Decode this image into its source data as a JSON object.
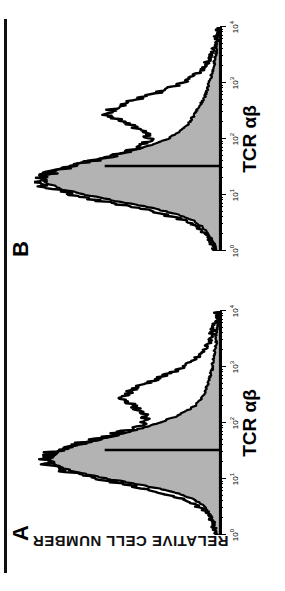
{
  "figure": {
    "y_axis_title": "RELATIVE CELL NUMBER",
    "orientation_note": "rotated-180",
    "colors": {
      "ink": "#000000",
      "fill_shaded": "#b3b3b3",
      "background": "#ffffff"
    }
  },
  "panels": [
    {
      "letter": "A",
      "x_axis_title": "TCR αβ",
      "ticks": [
        {
          "label_base": "10",
          "label_exp": "0",
          "value": 1
        },
        {
          "label_base": "10",
          "label_exp": "1",
          "value": 10
        },
        {
          "label_base": "10",
          "label_exp": "2",
          "value": 100
        },
        {
          "label_base": "10",
          "label_exp": "3",
          "value": 1000
        },
        {
          "label_base": "10",
          "label_exp": "4",
          "value": 10000
        }
      ]
    },
    {
      "letter": "B",
      "x_axis_title": "TCR αβ",
      "ticks": [
        {
          "label_base": "10",
          "label_exp": "0",
          "value": 1
        },
        {
          "label_base": "10",
          "label_exp": "1",
          "value": 10
        },
        {
          "label_base": "10",
          "label_exp": "2",
          "value": 100
        },
        {
          "label_base": "10",
          "label_exp": "3",
          "value": 1000
        },
        {
          "label_base": "10",
          "label_exp": "4",
          "value": 10000
        }
      ]
    }
  ],
  "chart_data": {
    "type": "line",
    "title": "",
    "xlabel": "TCR αβ",
    "ylabel": "RELATIVE CELL NUMBER",
    "xscale": "log",
    "xlim": [
      1,
      10000
    ],
    "ylim": [
      0,
      100
    ],
    "grid": false,
    "legend": null,
    "panels": [
      {
        "name": "A",
        "marker_line": {
          "x": 33,
          "y_from": 0,
          "y_to": 62,
          "orientation": "vertical-gate"
        },
        "series": [
          {
            "name": "shaded-histogram",
            "style": "filled",
            "fill": "#b3b3b3",
            "x": [
              1.0,
              1.3,
              1.7,
              2.2,
              2.8,
              3.6,
              4.6,
              6.0,
              7.7,
              10.0,
              12.9,
              16.6,
              21.4,
              27.6,
              35.5,
              45.7,
              58.9,
              75.9,
              97.7,
              125.9,
              162.2,
              208.9,
              269.2,
              346.7,
              446.7,
              575.4,
              741.3,
              954.9,
              1230.3,
              1584.9,
              2041.7,
              2630.3,
              3388.4,
              4365.2,
              5623.4,
              7244.4,
              9332.5,
              10000.0
            ],
            "y": [
              2,
              3,
              4,
              5,
              7,
              10,
              16,
              26,
              41,
              60,
              76,
              87,
              92,
              90,
              82,
              70,
              57,
              45,
              34,
              25,
              18,
              13,
              10,
              8,
              7,
              6,
              5,
              4,
              4,
              3,
              3,
              2,
              2,
              2,
              1,
              1,
              1,
              1
            ]
          },
          {
            "name": "outline-histogram",
            "style": "line",
            "stroke": "#000000",
            "x": [
              1.0,
              1.3,
              1.7,
              2.2,
              2.8,
              3.6,
              4.6,
              6.0,
              7.7,
              10.0,
              12.9,
              16.6,
              21.4,
              27.6,
              35.5,
              45.7,
              58.9,
              75.9,
              97.7,
              125.9,
              162.2,
              208.9,
              269.2,
              346.7,
              446.7,
              575.4,
              741.3,
              954.9,
              1230.3,
              1584.9,
              2041.7,
              2630.3,
              3388.4,
              4365.2,
              5623.4,
              7244.4,
              9332.5,
              10000.0
            ],
            "y": [
              2,
              3,
              4,
              6,
              9,
              14,
              22,
              34,
              49,
              65,
              80,
              90,
              95,
              93,
              85,
              73,
              60,
              49,
              42,
              40,
              43,
              48,
              52,
              50,
              44,
              36,
              28,
              21,
              15,
              11,
              8,
              6,
              5,
              4,
              3,
              2,
              2,
              1
            ]
          }
        ]
      },
      {
        "name": "B",
        "marker_line": {
          "x": 33,
          "y_from": 0,
          "y_to": 62,
          "orientation": "vertical-gate"
        },
        "series": [
          {
            "name": "shaded-histogram",
            "style": "filled",
            "fill": "#b3b3b3",
            "x": [
              1.0,
              1.3,
              1.7,
              2.2,
              2.8,
              3.6,
              4.6,
              6.0,
              7.7,
              10.0,
              12.9,
              16.6,
              21.4,
              27.6,
              35.5,
              45.7,
              58.9,
              75.9,
              97.7,
              125.9,
              162.2,
              208.9,
              269.2,
              346.7,
              446.7,
              575.4,
              741.3,
              954.9,
              1230.3,
              1584.9,
              2041.7,
              2630.3,
              3388.4,
              4365.2,
              5623.4,
              7244.4,
              9332.5,
              10000.0
            ],
            "y": [
              2,
              3,
              5,
              7,
              10,
              15,
              24,
              38,
              55,
              72,
              86,
              93,
              95,
              89,
              78,
              64,
              50,
              38,
              29,
              23,
              19,
              16,
              14,
              12,
              10,
              8,
              7,
              6,
              5,
              4,
              3,
              3,
              2,
              2,
              2,
              1,
              1,
              1
            ]
          },
          {
            "name": "outline-histogram",
            "style": "line",
            "stroke": "#000000",
            "x": [
              1.0,
              1.3,
              1.7,
              2.2,
              2.8,
              3.6,
              4.6,
              6.0,
              7.7,
              10.0,
              12.9,
              16.6,
              21.4,
              27.6,
              35.5,
              45.7,
              58.9,
              75.9,
              97.7,
              125.9,
              162.2,
              208.9,
              269.2,
              346.7,
              446.7,
              575.4,
              741.3,
              954.9,
              1230.3,
              1584.9,
              2041.7,
              2630.3,
              3388.4,
              4365.2,
              5623.4,
              7244.4,
              9332.5,
              10000.0
            ],
            "y": [
              2,
              4,
              6,
              9,
              13,
              20,
              31,
              46,
              63,
              79,
              91,
              97,
              96,
              88,
              76,
              62,
              50,
              42,
              38,
              40,
              46,
              54,
              60,
              58,
              50,
              40,
              30,
              22,
              16,
              11,
              8,
              6,
              4,
              3,
              2,
              2,
              1,
              1
            ]
          }
        ]
      }
    ]
  }
}
